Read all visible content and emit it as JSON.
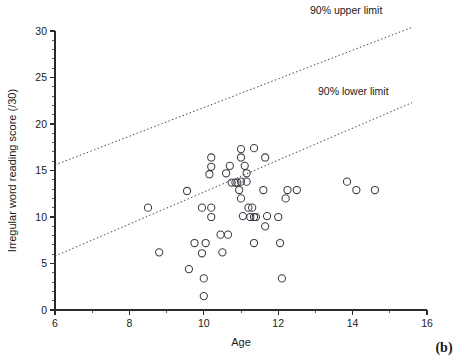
{
  "figure": {
    "panel_label": "(b)",
    "width": 466,
    "height": 362
  },
  "chart_data": {
    "type": "scatter",
    "title": "",
    "xlabel": "Age",
    "ylabel": "Irregular word reading score (/30)",
    "xlim": [
      6,
      16
    ],
    "ylim": [
      0,
      30
    ],
    "grid": false,
    "x_ticks": [
      6,
      8,
      10,
      12,
      14,
      16
    ],
    "x_tick_labels": [
      "6",
      "8",
      "10",
      "12",
      "14",
      "16"
    ],
    "x_minor_ticks": [
      7,
      9,
      11,
      13,
      15
    ],
    "y_ticks": [
      0,
      5,
      10,
      15,
      20,
      25,
      30
    ],
    "y_tick_labels": [
      "0",
      "5",
      "10",
      "15",
      "20",
      "25",
      "30"
    ],
    "y_minor_ticks": [
      1,
      2,
      3,
      4,
      6,
      7,
      8,
      9,
      11,
      12,
      13,
      14,
      16,
      17,
      18,
      19,
      21,
      22,
      23,
      24,
      26,
      27,
      28,
      29
    ],
    "marker": "open-circle",
    "marker_color": "#3c3c46",
    "series": [
      {
        "name": "Participants",
        "points": [
          [
            8.5,
            11.0
          ],
          [
            8.8,
            6.2
          ],
          [
            9.55,
            12.8
          ],
          [
            9.6,
            4.4
          ],
          [
            9.75,
            7.2
          ],
          [
            9.95,
            11.0
          ],
          [
            9.95,
            6.1
          ],
          [
            10.0,
            3.4
          ],
          [
            10.0,
            1.5
          ],
          [
            10.05,
            7.2
          ],
          [
            10.15,
            14.6
          ],
          [
            10.2,
            16.4
          ],
          [
            10.2,
            15.4
          ],
          [
            10.2,
            11.0
          ],
          [
            10.2,
            10.0
          ],
          [
            10.45,
            8.1
          ],
          [
            10.5,
            6.2
          ],
          [
            10.6,
            14.7
          ],
          [
            10.65,
            8.1
          ],
          [
            10.7,
            15.5
          ],
          [
            10.75,
            13.7
          ],
          [
            10.85,
            13.7
          ],
          [
            10.9,
            13.7
          ],
          [
            10.95,
            12.9
          ],
          [
            11.0,
            17.3
          ],
          [
            11.0,
            16.4
          ],
          [
            11.0,
            13.8
          ],
          [
            11.0,
            12.0
          ],
          [
            11.05,
            10.1
          ],
          [
            11.1,
            15.5
          ],
          [
            11.15,
            14.7
          ],
          [
            11.15,
            13.8
          ],
          [
            11.2,
            11.0
          ],
          [
            11.25,
            10.0
          ],
          [
            11.3,
            11.0
          ],
          [
            11.35,
            17.4
          ],
          [
            11.35,
            10.0
          ],
          [
            11.35,
            7.2
          ],
          [
            11.4,
            10.0
          ],
          [
            11.6,
            12.9
          ],
          [
            11.65,
            16.4
          ],
          [
            11.65,
            9.0
          ],
          [
            11.7,
            10.1
          ],
          [
            12.0,
            10.0
          ],
          [
            12.05,
            7.2
          ],
          [
            12.1,
            3.4
          ],
          [
            12.2,
            12.0
          ],
          [
            12.25,
            12.9
          ],
          [
            12.5,
            12.9
          ],
          [
            13.85,
            13.8
          ],
          [
            14.1,
            12.9
          ],
          [
            14.6,
            12.9
          ]
        ]
      }
    ],
    "reference_lines": [
      {
        "name": "90% upper limit",
        "label": "90% upper limit",
        "style": "dotted",
        "x_start": 6.0,
        "y_start": 15.6,
        "x_end": 15.6,
        "y_end": 30.4
      },
      {
        "name": "90% lower limit",
        "label": "90% lower limit",
        "style": "dotted",
        "x_start": 6.0,
        "y_start": 5.8,
        "x_end": 15.6,
        "y_end": 22.3
      }
    ],
    "annotations": [
      {
        "text": "90% upper limit",
        "x_px": 310,
        "y_px": 14
      },
      {
        "text": "90% lower limit",
        "x_px": 318,
        "y_px": 95
      }
    ]
  }
}
